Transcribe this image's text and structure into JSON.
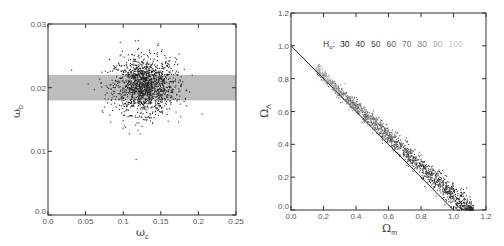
{
  "chart_data": [
    {
      "type": "scatter",
      "title": "",
      "xlabel": "ω_c",
      "xlabel_main": "ω",
      "xlabel_sub": "c",
      "ylabel": "ω_b",
      "ylabel_main": "ω",
      "ylabel_sub": "b",
      "xlim": [
        0.0,
        0.25
      ],
      "ylim": [
        0.0,
        0.03
      ],
      "xticks": [
        "0.0",
        "0.05",
        "0.1",
        "0.15",
        "0.2",
        "0.25"
      ],
      "yticks": [
        "0.0",
        "0.01",
        "0.02",
        "0.03"
      ],
      "grid": false,
      "band": {
        "y_from": 0.018,
        "y_to": 0.022,
        "color": "#bdbdbd"
      },
      "cluster": {
        "center_x": 0.128,
        "center_y": 0.0203,
        "sd_x": 0.02,
        "sd_y": 0.0022,
        "n_points": 1400,
        "color": "#222222"
      }
    },
    {
      "type": "scatter",
      "title": "",
      "xlabel": "Ω_m",
      "xlabel_main": "Ω",
      "xlabel_sub": "m",
      "ylabel": "Ω_Λ",
      "ylabel_main": "Ω",
      "ylabel_sub": "Λ",
      "xlim": [
        0.0,
        1.2
      ],
      "ylim": [
        0.0,
        1.2
      ],
      "xticks": [
        "0.0",
        "0.2",
        "0.4",
        "0.6",
        "0.8",
        "1.0",
        "1.2"
      ],
      "yticks": [
        "0.0",
        "0.2",
        "0.4",
        "0.6",
        "0.8",
        "1.0",
        "1.2"
      ],
      "grid": false,
      "reference_line": {
        "x1": 0.0,
        "y1": 1.0,
        "x2": 1.0,
        "y2": 0.0,
        "label": "flat universe Ω_m + Ω_Λ = 1"
      },
      "band_range": {
        "x_from": 0.15,
        "x_to": 1.12
      },
      "n_points": 1600,
      "legend": {
        "prefix": "H",
        "prefix_sub": "o",
        "separator": ":",
        "entries": [
          {
            "label": "30",
            "color": "#222222"
          },
          {
            "label": "40",
            "color": "#333333"
          },
          {
            "label": "50",
            "color": "#444444"
          },
          {
            "label": "60",
            "color": "#5a5a5a"
          },
          {
            "label": "70",
            "color": "#707070"
          },
          {
            "label": "80",
            "color": "#8c8c8c"
          },
          {
            "label": "90",
            "color": "#acacac"
          },
          {
            "label": "100",
            "color": "#c8c8c8"
          }
        ]
      }
    }
  ]
}
